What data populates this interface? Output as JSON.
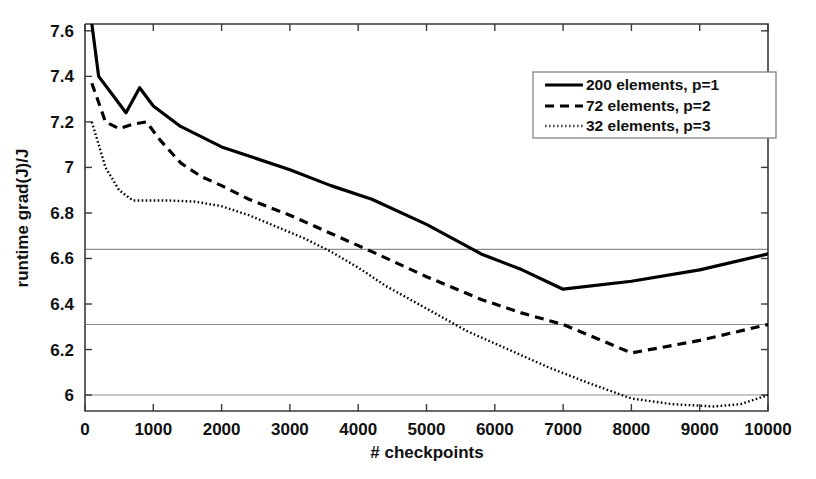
{
  "chart_data": {
    "type": "line",
    "title": "",
    "xlabel": "# checkpoints",
    "ylabel": "runtime grad(J)/J",
    "xlim": [
      0,
      10000
    ],
    "ylim": [
      5.93,
      7.63
    ],
    "xticks": [
      0,
      1000,
      2000,
      3000,
      4000,
      5000,
      6000,
      7000,
      8000,
      9000,
      10000
    ],
    "xtick_labels": [
      "0",
      "1000",
      "2000",
      "3000",
      "4000",
      "5000",
      "6000",
      "7000",
      "8000",
      "9000",
      "10000"
    ],
    "yticks": [
      6,
      6.2,
      6.4,
      6.6,
      6.8,
      7,
      7.2,
      7.4,
      7.6
    ],
    "ytick_labels": [
      "6",
      "6.2",
      "6.4",
      "6.6",
      "6.8",
      "7",
      "7.2",
      "7.4",
      "7.6"
    ],
    "grid": true,
    "grid_axis": "y",
    "gridlines": [
      6.64,
      6.31,
      6.0
    ],
    "legend_position": "top-right",
    "series": [
      {
        "name": "200 elements, p=1",
        "style": "solid",
        "color": "#000000",
        "width": 3.2,
        "dash": "",
        "x": [
          100,
          200,
          400,
          600,
          800,
          1000,
          1400,
          2000,
          2400,
          3000,
          3600,
          4200,
          5000,
          5800,
          6400,
          7000,
          8000,
          9000,
          10000
        ],
        "y": [
          7.63,
          7.4,
          7.32,
          7.24,
          7.35,
          7.27,
          7.18,
          7.09,
          7.05,
          6.99,
          6.92,
          6.86,
          6.75,
          6.62,
          6.55,
          6.465,
          6.5,
          6.55,
          6.62
        ]
      },
      {
        "name": "72 elements, p=2",
        "style": "dashed",
        "color": "#000000",
        "width": 3.2,
        "dash": "9,6",
        "x": [
          100,
          300,
          500,
          700,
          900,
          1100,
          1400,
          1700,
          2000,
          2400,
          3000,
          3600,
          4200,
          5000,
          5800,
          6400,
          7000,
          8000,
          9000,
          10000
        ],
        "y": [
          7.37,
          7.2,
          7.17,
          7.19,
          7.2,
          7.12,
          7.02,
          6.96,
          6.92,
          6.86,
          6.79,
          6.71,
          6.63,
          6.52,
          6.42,
          6.36,
          6.31,
          6.185,
          6.24,
          6.31
        ]
      },
      {
        "name": "32 elements, p=3",
        "style": "dotted",
        "color": "#4a4a4a",
        "width": 2.4,
        "dash": "1.6,2.4",
        "x": [
          100,
          300,
          500,
          700,
          900,
          1200,
          1600,
          2000,
          2400,
          2800,
          3200,
          3600,
          4000,
          4400,
          5000,
          5600,
          6200,
          6800,
          7400,
          8000,
          8600,
          9200,
          9600,
          10000
        ],
        "y": [
          7.2,
          7.0,
          6.9,
          6.855,
          6.855,
          6.855,
          6.85,
          6.83,
          6.79,
          6.74,
          6.69,
          6.63,
          6.56,
          6.48,
          6.38,
          6.28,
          6.2,
          6.12,
          6.05,
          5.985,
          5.96,
          5.95,
          5.96,
          6.0
        ]
      }
    ]
  },
  "legend": {
    "entries": [
      {
        "label": "200 elements, p=1",
        "sample": "solid-line-sample"
      },
      {
        "label": "72 elements, p=2",
        "sample": "dashed-line-sample"
      },
      {
        "label": "32 elements, p=3",
        "sample": "dotted-line-sample"
      }
    ]
  }
}
